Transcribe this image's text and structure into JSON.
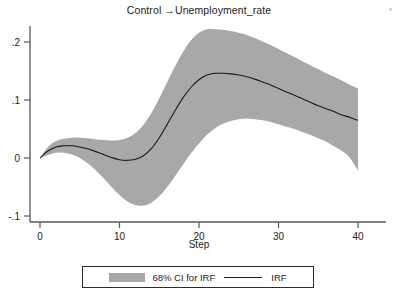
{
  "title": "Control →Unemployment_rate",
  "axis": {
    "x_title": "Step",
    "y_ticks": [
      ".2",
      ".1",
      "0",
      "-.1"
    ],
    "x_ticks": [
      "0",
      "10",
      "20",
      "30",
      "40"
    ]
  },
  "legend": {
    "ci_label": "68% CI for IRF",
    "irf_label": "IRF",
    "ci_color": "#a8a8a8",
    "irf_color": "#1a1a1a"
  },
  "chart_data": {
    "type": "line",
    "title": "Control →Unemployment_rate",
    "xlabel": "Step",
    "ylabel": "",
    "xlim": [
      0,
      40
    ],
    "ylim": [
      -0.1,
      0.22
    ],
    "grid": false,
    "legend_position": "bottom",
    "x": [
      0,
      1,
      2,
      3,
      4,
      5,
      6,
      7,
      8,
      9,
      10,
      11,
      12,
      13,
      14,
      15,
      16,
      17,
      18,
      19,
      20,
      21,
      22,
      23,
      24,
      25,
      26,
      27,
      28,
      29,
      30,
      31,
      32,
      33,
      34,
      35,
      36,
      37,
      38,
      39,
      40
    ],
    "series": [
      {
        "name": "IRF",
        "values": [
          0,
          0.012,
          0.019,
          0.021,
          0.021,
          0.019,
          0.016,
          0.011,
          0.006,
          0.001,
          -0.003,
          -0.004,
          -0.002,
          0.004,
          0.016,
          0.035,
          0.058,
          0.082,
          0.104,
          0.122,
          0.135,
          0.143,
          0.146,
          0.146,
          0.145,
          0.143,
          0.14,
          0.136,
          0.131,
          0.126,
          0.12,
          0.114,
          0.108,
          0.102,
          0.096,
          0.09,
          0.085,
          0.08,
          0.074,
          0.07,
          0.065
        ]
      },
      {
        "name": "68% CI upper",
        "values": [
          0.0,
          0.019,
          0.029,
          0.033,
          0.035,
          0.035,
          0.034,
          0.032,
          0.031,
          0.03,
          0.031,
          0.035,
          0.043,
          0.057,
          0.077,
          0.103,
          0.131,
          0.158,
          0.183,
          0.203,
          0.216,
          0.222,
          0.222,
          0.221,
          0.219,
          0.216,
          0.212,
          0.207,
          0.201,
          0.195,
          0.188,
          0.181,
          0.174,
          0.167,
          0.16,
          0.153,
          0.146,
          0.14,
          0.133,
          0.126,
          0.12
        ]
      },
      {
        "name": "68% CI lower",
        "values": [
          0.0,
          0.005,
          0.009,
          0.009,
          0.006,
          0.0,
          -0.009,
          -0.021,
          -0.035,
          -0.05,
          -0.064,
          -0.075,
          -0.081,
          -0.082,
          -0.077,
          -0.066,
          -0.05,
          -0.031,
          -0.011,
          0.008,
          0.025,
          0.04,
          0.051,
          0.059,
          0.064,
          0.067,
          0.068,
          0.067,
          0.065,
          0.062,
          0.058,
          0.054,
          0.05,
          0.045,
          0.04,
          0.034,
          0.028,
          0.02,
          0.012,
          0.0,
          -0.022
        ]
      }
    ]
  }
}
